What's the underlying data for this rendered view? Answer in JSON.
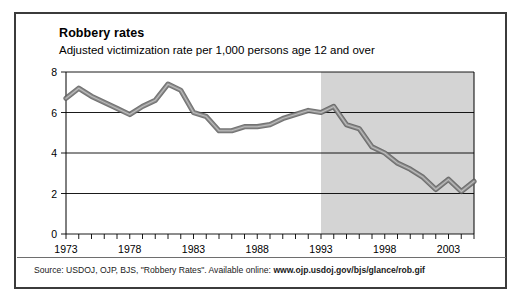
{
  "chart_title": "Robbery rates",
  "chart_subtitle": "Adjusted victimization rate per 1,000 persons age 12 and over",
  "source": {
    "prefix": "Source: USDOJ, OJP, BJS, \"Robbery Rates\". Available online: ",
    "url": "www.ojp.usdoj.gov/bjs/glance/rob.gif"
  },
  "colors": {
    "frame": "#3b3b3b",
    "line": "#8c8c8c",
    "line_edge": "#5a5a5a",
    "shaded_band": "#d4d4d4",
    "gridline": "#000000",
    "background": "#ffffff"
  },
  "chart_data": {
    "type": "line",
    "title": "Robbery rates",
    "subtitle": "Adjusted victimization rate per 1,000 persons age 12 and over",
    "xlabel": "",
    "ylabel": "",
    "xlim": [
      1973,
      2005
    ],
    "ylim": [
      0,
      8
    ],
    "ytick_values": [
      0,
      2,
      4,
      6,
      8
    ],
    "ytick_labels": [
      "0",
      "2",
      "4",
      "6",
      "8"
    ],
    "xtick_labels": [
      "1973",
      "1978",
      "1983",
      "1988",
      "1993",
      "1998",
      "2003"
    ],
    "xtick_label_values": [
      1973,
      1978,
      1983,
      1988,
      1993,
      1998,
      2003
    ],
    "minor_xticks_every": 1,
    "grid": "horizontal",
    "legend": "none",
    "shaded_region": {
      "x_start": 1993,
      "x_end": 2005,
      "label": ""
    },
    "series": [
      {
        "name": "Robbery rate",
        "x": [
          1973,
          1974,
          1975,
          1976,
          1977,
          1978,
          1979,
          1980,
          1981,
          1982,
          1983,
          1984,
          1985,
          1986,
          1987,
          1988,
          1989,
          1990,
          1991,
          1992,
          1993,
          1994,
          1995,
          1996,
          1997,
          1998,
          1999,
          2000,
          2001,
          2002,
          2003,
          2004,
          2005
        ],
        "values": [
          6.7,
          7.2,
          6.8,
          6.5,
          6.2,
          5.9,
          6.3,
          6.6,
          7.4,
          7.1,
          6.0,
          5.8,
          5.1,
          5.1,
          5.3,
          5.3,
          5.4,
          5.7,
          5.9,
          6.1,
          6.0,
          6.3,
          5.4,
          5.2,
          4.3,
          4.0,
          3.5,
          3.2,
          2.8,
          2.2,
          2.7,
          2.1,
          2.6
        ]
      }
    ]
  }
}
